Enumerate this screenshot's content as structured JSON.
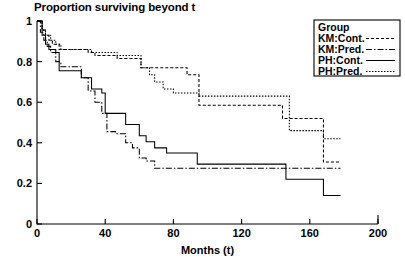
{
  "chart_data": {
    "type": "line",
    "title": "Proportion surviving beyond t",
    "xlabel": "Months (t)",
    "ylabel": "",
    "xlim": [
      0,
      200
    ],
    "ylim": [
      0,
      1
    ],
    "xticks": [
      0,
      40,
      80,
      120,
      160,
      200
    ],
    "yticks": [
      0,
      0.2,
      0.4,
      0.6,
      0.8,
      1
    ],
    "xtick_labels": [
      "0",
      "40",
      "80",
      "120",
      "160",
      "200"
    ],
    "ytick_labels": [
      "0",
      "0.2",
      "0.4",
      "0.6",
      "0.8",
      "1"
    ],
    "grid": false,
    "step_type": "post",
    "legend": {
      "title": "Group",
      "position": "top-right",
      "entries": [
        {
          "label": "KM:Cont.",
          "dash": "3,2"
        },
        {
          "label": "KM:Pred.",
          "dash": "6,2,1.5,2"
        },
        {
          "label": "PH:Cont.",
          "dash": "none"
        },
        {
          "label": "PH:Pred.",
          "dash": "1.5,1.5"
        }
      ]
    },
    "series": [
      {
        "name": "KM:Cont.",
        "dash": "3,2",
        "color": "#000000",
        "points": [
          [
            0,
            1.0
          ],
          [
            3,
            0.955
          ],
          [
            5,
            0.93
          ],
          [
            7,
            0.905
          ],
          [
            9,
            0.885
          ],
          [
            13,
            0.86
          ],
          [
            26,
            0.86
          ],
          [
            30,
            0.845
          ],
          [
            34,
            0.83
          ],
          [
            40,
            0.83
          ],
          [
            47,
            0.815
          ],
          [
            53,
            0.815
          ],
          [
            61,
            0.77
          ],
          [
            68,
            0.77
          ],
          [
            80,
            0.77
          ],
          [
            88,
            0.735
          ],
          [
            95,
            0.585
          ],
          [
            120,
            0.585
          ],
          [
            142,
            0.585
          ],
          [
            144,
            0.52
          ],
          [
            160,
            0.52
          ],
          [
            168,
            0.305
          ],
          [
            178,
            0.305
          ]
        ]
      },
      {
        "name": "KM:Pred.",
        "dash": "6,2,1.5,2",
        "color": "#000000",
        "points": [
          [
            0,
            1.0
          ],
          [
            2,
            0.945
          ],
          [
            4,
            0.905
          ],
          [
            6,
            0.875
          ],
          [
            8,
            0.845
          ],
          [
            11,
            0.8
          ],
          [
            14,
            0.775
          ],
          [
            22,
            0.775
          ],
          [
            26,
            0.72
          ],
          [
            30,
            0.655
          ],
          [
            34,
            0.6
          ],
          [
            38,
            0.545
          ],
          [
            41,
            0.455
          ],
          [
            46,
            0.445
          ],
          [
            52,
            0.4
          ],
          [
            56,
            0.375
          ],
          [
            60,
            0.325
          ],
          [
            64,
            0.31
          ],
          [
            69,
            0.275
          ],
          [
            95,
            0.275
          ],
          [
            142,
            0.275
          ],
          [
            168,
            0.275
          ],
          [
            178,
            0.275
          ]
        ]
      },
      {
        "name": "PH:Cont.",
        "dash": "none",
        "color": "#000000",
        "points": [
          [
            0,
            1.0
          ],
          [
            3,
            0.93
          ],
          [
            5,
            0.885
          ],
          [
            7,
            0.86
          ],
          [
            11,
            0.845
          ],
          [
            13,
            0.755
          ],
          [
            22,
            0.755
          ],
          [
            26,
            0.72
          ],
          [
            32,
            0.665
          ],
          [
            38,
            0.645
          ],
          [
            40,
            0.545
          ],
          [
            46,
            0.545
          ],
          [
            52,
            0.49
          ],
          [
            56,
            0.49
          ],
          [
            60,
            0.435
          ],
          [
            64,
            0.405
          ],
          [
            69,
            0.375
          ],
          [
            76,
            0.35
          ],
          [
            88,
            0.35
          ],
          [
            94,
            0.295
          ],
          [
            120,
            0.295
          ],
          [
            142,
            0.295
          ],
          [
            146,
            0.22
          ],
          [
            160,
            0.22
          ],
          [
            168,
            0.14
          ],
          [
            178,
            0.14
          ]
        ]
      },
      {
        "name": "PH:Pred.",
        "dash": "1.5,1.5",
        "color": "#000000",
        "points": [
          [
            0,
            1.0
          ],
          [
            3,
            0.955
          ],
          [
            5,
            0.93
          ],
          [
            8,
            0.905
          ],
          [
            11,
            0.885
          ],
          [
            14,
            0.86
          ],
          [
            26,
            0.86
          ],
          [
            32,
            0.845
          ],
          [
            40,
            0.845
          ],
          [
            47,
            0.83
          ],
          [
            53,
            0.83
          ],
          [
            61,
            0.77
          ],
          [
            66,
            0.735
          ],
          [
            69,
            0.7
          ],
          [
            74,
            0.665
          ],
          [
            80,
            0.645
          ],
          [
            88,
            0.645
          ],
          [
            95,
            0.63
          ],
          [
            120,
            0.63
          ],
          [
            142,
            0.63
          ],
          [
            148,
            0.46
          ],
          [
            160,
            0.46
          ],
          [
            168,
            0.42
          ],
          [
            178,
            0.42
          ]
        ]
      }
    ]
  }
}
